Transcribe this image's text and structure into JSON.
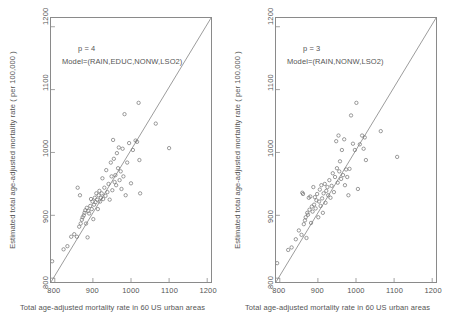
{
  "figure": {
    "panels": [
      {
        "id": "left",
        "annotation_p": "p = 4",
        "annotation_model": "Model=(RAIN,EDUC,NONW,LSO2)",
        "xlabel": "Total age-adjusted mortality rate in 60 US urban areas",
        "ylabel": "Estimated total age-adjusted mortality rate ( per 100,000 )"
      },
      {
        "id": "right",
        "annotation_p": "p = 3",
        "annotation_model": "Model=(RAIN,NONW,LSO2)",
        "xlabel": "Total age-adjusted mortality rate in 60 US urban areas",
        "ylabel": "Estimated total age-adjusted mortality rate ( per 100,000 )"
      }
    ],
    "axis_ticks": {
      "x": [
        "800",
        "900",
        "1000",
        "1100",
        "1200"
      ],
      "y": [
        "800",
        "900",
        "1000",
        "1100",
        "1200"
      ]
    },
    "colors": {
      "frame": "#8a8a8a",
      "marker": "#6f6f6f",
      "line": "#6f6f6f",
      "text": "#555555",
      "background": "#ffffff"
    }
  },
  "chart_data": [
    {
      "type": "scatter",
      "title": "",
      "subtitle": "p = 4, Model=(RAIN,EDUC,NONW,LSO2)",
      "xlabel": "Total age-adjusted mortality rate in 60 US urban areas",
      "ylabel": "Estimated total age-adjusted mortality rate ( per 100,000 )",
      "xlim": [
        790,
        1210
      ],
      "ylim": [
        790,
        1210
      ],
      "xticks": [
        800,
        900,
        1000,
        1100,
        1200
      ],
      "yticks": [
        800,
        900,
        1000,
        1100,
        1200
      ],
      "grid": false,
      "legend": null,
      "reference_line": {
        "type": "identity",
        "x": [
          790,
          1210
        ],
        "y": [
          790,
          1210
        ]
      },
      "marker": "open-circle",
      "points": [
        [
          793,
          823
        ],
        [
          823,
          842
        ],
        [
          833,
          847
        ],
        [
          843,
          862
        ],
        [
          851,
          866
        ],
        [
          858,
          862
        ],
        [
          860,
          940
        ],
        [
          864,
          878
        ],
        [
          866,
          928
        ],
        [
          868,
          883
        ],
        [
          871,
          889
        ],
        [
          873,
          893
        ],
        [
          876,
          896
        ],
        [
          878,
          900
        ],
        [
          880,
          904
        ],
        [
          882,
          883
        ],
        [
          884,
          908
        ],
        [
          886,
          861
        ],
        [
          888,
          903
        ],
        [
          890,
          899
        ],
        [
          893,
          911
        ],
        [
          895,
          922
        ],
        [
          897,
          906
        ],
        [
          899,
          918
        ],
        [
          901,
          890
        ],
        [
          903,
          913
        ],
        [
          905,
          924
        ],
        [
          907,
          917
        ],
        [
          909,
          931
        ],
        [
          911,
          921
        ],
        [
          913,
          906
        ],
        [
          915,
          928
        ],
        [
          917,
          935
        ],
        [
          919,
          918
        ],
        [
          921,
          924
        ],
        [
          923,
          931
        ],
        [
          925,
          955
        ],
        [
          927,
          922
        ],
        [
          930,
          940
        ],
        [
          933,
          927
        ],
        [
          935,
          968
        ],
        [
          938,
          933
        ],
        [
          941,
          946
        ],
        [
          944,
          921
        ],
        [
          947,
          980
        ],
        [
          949,
          958
        ],
        [
          951,
          936
        ],
        [
          953,
          1016
        ],
        [
          955,
          986
        ],
        [
          957,
          949
        ],
        [
          959,
          960
        ],
        [
          961,
          944
        ],
        [
          963,
          995
        ],
        [
          966,
          971
        ],
        [
          968,
          1004
        ],
        [
          970,
          952
        ],
        [
          973,
          966
        ],
        [
          975,
          938
        ],
        [
          978,
          1002
        ],
        [
          980,
          958
        ],
        [
          983,
          1057
        ],
        [
          986,
          928
        ],
        [
          990,
          980
        ],
        [
          995,
          1011
        ],
        [
          1000,
          947
        ],
        [
          1005,
          1000
        ],
        [
          1012,
          1015
        ],
        [
          1016,
          1013
        ],
        [
          1020,
          1075
        ],
        [
          1022,
          984
        ],
        [
          1024,
          931
        ],
        [
          1065,
          1042
        ],
        [
          1100,
          1003
        ]
      ]
    },
    {
      "type": "scatter",
      "title": "",
      "subtitle": "p = 3, Model=(RAIN,NONW,LSO2)",
      "xlabel": "Total age-adjusted mortality rate in 60 US urban areas",
      "ylabel": "Estimated total age-adjusted mortality rate ( per 100,000 )",
      "xlim": [
        790,
        1210
      ],
      "ylim": [
        790,
        1210
      ],
      "xticks": [
        800,
        900,
        1000,
        1100,
        1200
      ],
      "yticks": [
        800,
        900,
        1000,
        1100,
        1200
      ],
      "grid": false,
      "legend": null,
      "reference_line": {
        "type": "identity",
        "x": [
          790,
          1210
        ],
        "y": [
          790,
          1210
        ]
      },
      "marker": "open-circle",
      "points": [
        [
          793,
          820
        ],
        [
          822,
          841
        ],
        [
          831,
          845
        ],
        [
          842,
          858
        ],
        [
          850,
          872
        ],
        [
          857,
          865
        ],
        [
          859,
          932
        ],
        [
          861,
          930
        ],
        [
          863,
          882
        ],
        [
          866,
          888
        ],
        [
          868,
          893
        ],
        [
          870,
          860
        ],
        [
          872,
          900
        ],
        [
          874,
          897
        ],
        [
          876,
          924
        ],
        [
          878,
          905
        ],
        [
          880,
          926
        ],
        [
          882,
          884
        ],
        [
          884,
          910
        ],
        [
          886,
          902
        ],
        [
          888,
          941
        ],
        [
          890,
          913
        ],
        [
          892,
          925
        ],
        [
          894,
          907
        ],
        [
          896,
          920
        ],
        [
          898,
          930
        ],
        [
          901,
          893
        ],
        [
          903,
          918
        ],
        [
          905,
          937
        ],
        [
          907,
          911
        ],
        [
          909,
          944
        ],
        [
          911,
          923
        ],
        [
          913,
          900
        ],
        [
          915,
          931
        ],
        [
          918,
          946
        ],
        [
          920,
          916
        ],
        [
          922,
          935
        ],
        [
          925,
          941
        ],
        [
          927,
          928
        ],
        [
          930,
          952
        ],
        [
          933,
          924
        ],
        [
          936,
          943
        ],
        [
          939,
          963
        ],
        [
          942,
          933
        ],
        [
          945,
          957
        ],
        [
          948,
          1014
        ],
        [
          950,
          971
        ],
        [
          952,
          948
        ],
        [
          954,
          1023
        ],
        [
          956,
          966
        ],
        [
          958,
          982
        ],
        [
          961,
          954
        ],
        [
          963,
          1000
        ],
        [
          966,
          960
        ],
        [
          969,
          1017
        ],
        [
          971,
          944
        ],
        [
          974,
          969
        ],
        [
          977,
          957
        ],
        [
          980,
          928
        ],
        [
          983,
          970
        ],
        [
          987,
          1055
        ],
        [
          992,
          1010
        ],
        [
          997,
          1000
        ],
        [
          1001,
          1075
        ],
        [
          1005,
          938
        ],
        [
          1010,
          1009
        ],
        [
          1016,
          1023
        ],
        [
          1020,
          1002
        ],
        [
          1023,
          1020
        ],
        [
          1026,
          984
        ],
        [
          1065,
          1030
        ],
        [
          1108,
          989
        ]
      ]
    }
  ]
}
